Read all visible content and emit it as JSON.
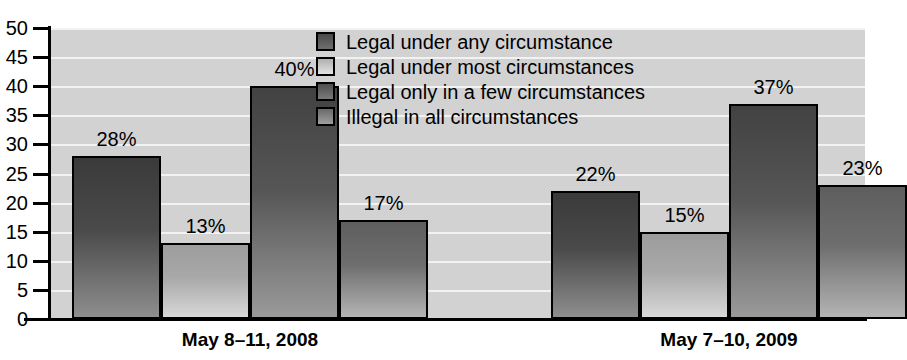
{
  "chart_data": {
    "type": "bar",
    "title": "",
    "xlabel": "",
    "ylabel": "",
    "ylim": [
      0,
      50
    ],
    "ytick_labels": [
      "50",
      "45",
      "40",
      "35",
      "30",
      "25",
      "20",
      "15",
      "10",
      "5",
      "0"
    ],
    "ytick_values": [
      50,
      45,
      40,
      35,
      30,
      25,
      20,
      15,
      10,
      5,
      0
    ],
    "grid": true,
    "legend_position": "top-center",
    "categories": [
      "May 8–11, 2008",
      "May 7–10, 2009"
    ],
    "series": [
      {
        "name": "Legal under any circumstance",
        "values": [
          28,
          15
        ],
        "labels": [
          "28%",
          "22%"
        ]
      },
      {
        "name": "Legal under most circumstances",
        "values": [
          13,
          15
        ],
        "labels": [
          "13%",
          "15%"
        ]
      },
      {
        "name": "Legal only in a few circumstances",
        "values": [
          40,
          37
        ],
        "labels": [
          "40%",
          "37%"
        ]
      },
      {
        "name": "Illegal in all circumstances",
        "values": [
          17,
          23
        ],
        "labels": [
          "17%",
          "23%"
        ]
      }
    ],
    "groups": [
      {
        "category": "May 8–11, 2008",
        "bars": [
          {
            "series": "Legal under any circumstance",
            "value": 28,
            "label": "28%"
          },
          {
            "series": "Legal under most circumstances",
            "value": 13,
            "label": "13%"
          },
          {
            "series": "Legal only in a few circumstances",
            "value": 40,
            "label": "40%"
          },
          {
            "series": "Illegal in all circumstances",
            "value": 17,
            "label": "17%"
          }
        ]
      },
      {
        "category": "May 7–10, 2009",
        "bars": [
          {
            "series": "Legal under any circumstance",
            "value": 22,
            "label": "22%"
          },
          {
            "series": "Legal under most circumstances",
            "value": 15,
            "label": "15%"
          },
          {
            "series": "Legal only in a few circumstances",
            "value": 37,
            "label": "37%"
          },
          {
            "series": "Illegal in all circumstances",
            "value": 23,
            "label": "23%"
          }
        ]
      }
    ],
    "colors": {
      "plot_background": "#d2d2d2",
      "gridline": "#f2f2f2",
      "axis": "#000000",
      "series_1": "#4a4a4a",
      "series_2": "#b0b0b0",
      "series_3": "#565656",
      "series_4": "#6e6e6e",
      "text": "#000000"
    }
  },
  "legend": {
    "items": [
      {
        "label": "Legal under any circumstance"
      },
      {
        "label": "Legal under most circumstances"
      },
      {
        "label": "Legal only in a few circumstances"
      },
      {
        "label": "Illegal in all circumstances"
      }
    ]
  }
}
